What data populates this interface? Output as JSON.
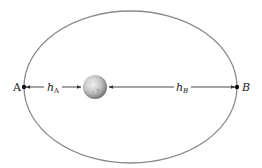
{
  "diagram": {
    "title": "",
    "labels": {
      "point_a": "A",
      "point_b": "B",
      "distance_a_main": "h",
      "distance_a_sub": "A",
      "distance_b_main": "h",
      "distance_b_sub": "B"
    },
    "colors": {
      "orbit": "#8a8a8a",
      "arrow": "#333333",
      "planet_light": "#e6e6e6",
      "planet_dark": "#6e6e6e"
    },
    "elements": {
      "orbit": "ellipse",
      "body": "planet",
      "points": [
        "A",
        "B"
      ],
      "distances": [
        "h_A",
        "h_B"
      ]
    }
  }
}
